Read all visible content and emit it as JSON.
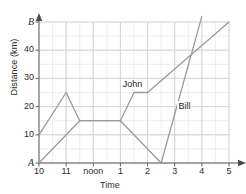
{
  "chart_data": {
    "type": "line",
    "title": "",
    "xlabel": "Time",
    "ylabel": "Distance (km)",
    "xlim": [
      10,
      17
    ],
    "ylim": [
      0,
      50
    ],
    "grid": true,
    "legend": "inline-labels",
    "xtick_labels": [
      "10",
      "11",
      "noon",
      "1",
      "2",
      "3",
      "4",
      "5"
    ],
    "xtick_values": [
      10,
      11,
      12,
      13,
      14,
      15,
      16,
      17
    ],
    "ytick_labels": [
      "A",
      "10",
      "20",
      "30",
      "40",
      "B"
    ],
    "ytick_values": [
      0,
      10,
      20,
      30,
      40,
      50
    ],
    "minor_x_step": 0.5,
    "minor_y_step": 5,
    "axis_endpoint_top_label": "B",
    "axis_endpoint_origin_label": "A",
    "series": [
      {
        "name": "John",
        "color": "#9a9a9a",
        "label_x": 13.05,
        "label_y": 27.5,
        "points": [
          {
            "x": 10.0,
            "y": 10
          },
          {
            "x": 11.0,
            "y": 25
          },
          {
            "x": 11.5,
            "y": 15
          },
          {
            "x": 13.0,
            "y": 15
          },
          {
            "x": 14.5,
            "y": 0
          }
        ]
      },
      {
        "name": "Bill",
        "color": "#9a9a9a",
        "label_x": 15.1,
        "label_y": 20,
        "points": [
          {
            "x": 10.0,
            "y": 0
          },
          {
            "x": 11.5,
            "y": 15
          },
          {
            "x": 13.0,
            "y": 15
          },
          {
            "x": 13.5,
            "y": 25
          },
          {
            "x": 14.0,
            "y": 25
          },
          {
            "x": 17.0,
            "y": 50
          }
        ]
      },
      {
        "name": "bill-steep-segment",
        "color": "#9a9a9a",
        "label_x": null,
        "label_y": null,
        "points": [
          {
            "x": 14.5,
            "y": 0
          },
          {
            "x": 16.0,
            "y": 52
          }
        ]
      }
    ]
  },
  "axes": {
    "y_title": "Distance (km)",
    "x_title": "Time"
  }
}
